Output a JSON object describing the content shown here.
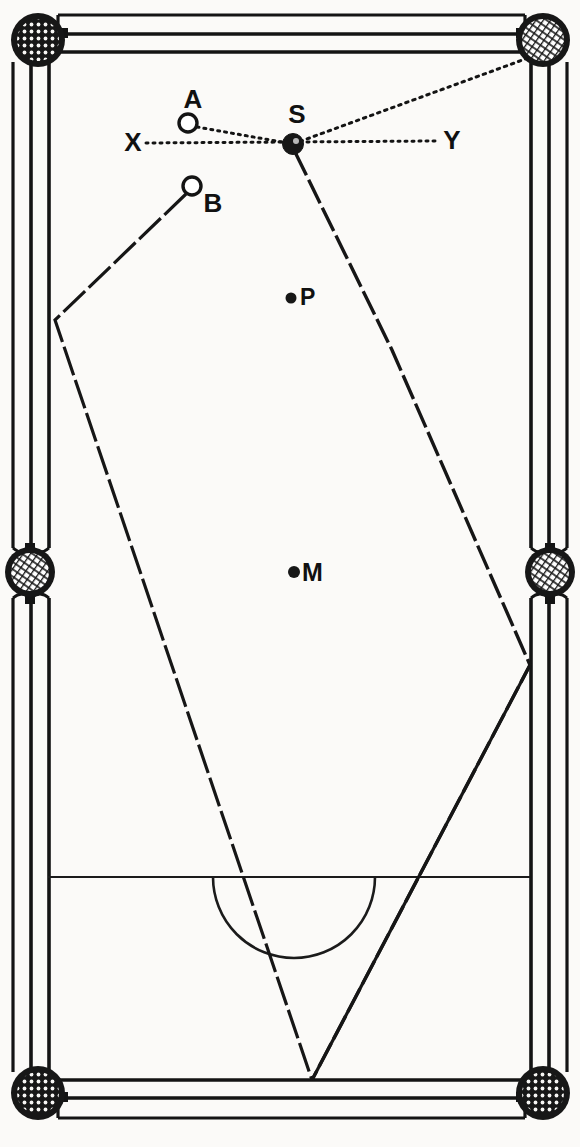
{
  "figure": {
    "kind": "billiard-table-diagram",
    "title_text": "",
    "width": 580,
    "height": 1147,
    "paper_color": "#fbfaf8",
    "ink_color": "#111111"
  },
  "table": {
    "name": "billiard-table",
    "outer_rect": {
      "x": 12,
      "y": 14,
      "w": 556,
      "h": 1118
    },
    "rail_lines_x": [
      12,
      30,
      48,
      530,
      548,
      568
    ],
    "rail_lines_y": [
      15,
      34,
      52,
      1080,
      1098,
      1118
    ],
    "playing_area": {
      "x": 48,
      "y": 52,
      "w": 482,
      "h": 1028
    },
    "cushion_color": "#111111"
  },
  "pockets": [
    {
      "id": "pocket-top-left",
      "label": "top left pocket",
      "cx": 38,
      "cy": 40,
      "r": 27
    },
    {
      "id": "pocket-top-right",
      "label": "top right pocket",
      "cx": 543,
      "cy": 40,
      "r": 27
    },
    {
      "id": "pocket-middle-left",
      "label": "middle left pocket",
      "cx": 30,
      "cy": 572,
      "r": 25
    },
    {
      "id": "pocket-middle-right",
      "label": "middle right pocket",
      "cx": 550,
      "cy": 572,
      "r": 25
    },
    {
      "id": "pocket-bottom-left",
      "label": "bottom left pocket",
      "cx": 38,
      "cy": 1093,
      "r": 27
    },
    {
      "id": "pocket-bottom-right",
      "label": "bottom right pocket",
      "cx": 543,
      "cy": 1093,
      "r": 27
    }
  ],
  "balls": [
    {
      "id": "ball-a",
      "label": "A",
      "cx": 188,
      "cy": 123,
      "r": 9,
      "style": "open",
      "label_x": 193,
      "label_y": 108,
      "label_anchor": "middle",
      "label_size": 26
    },
    {
      "id": "ball-b",
      "label": "B",
      "cx": 192,
      "cy": 186,
      "r": 9,
      "style": "open",
      "label_x": 213,
      "label_y": 212,
      "label_anchor": "middle",
      "label_size": 26
    },
    {
      "id": "ball-s",
      "label": "S",
      "cx": 293,
      "cy": 144,
      "r": 10,
      "style": "filled",
      "label_x": 297,
      "label_y": 123,
      "label_anchor": "middle",
      "label_size": 26
    }
  ],
  "spots": [
    {
      "id": "spot-p",
      "label": "P",
      "cx": 291,
      "cy": 298,
      "r": 5,
      "label_x": 300,
      "label_y": 305,
      "label_anchor": "start",
      "label_size": 22
    },
    {
      "id": "spot-m",
      "label": "M",
      "cx": 294,
      "cy": 572,
      "r": 6,
      "label_x": 302,
      "label_y": 581,
      "label_anchor": "start",
      "label_size": 24
    }
  ],
  "axis_line": {
    "id": "line-x-y",
    "label_left": "X",
    "label_right": "Y",
    "x1": 146,
    "y1": 143,
    "x2": 437,
    "y2": 141,
    "label_left_x": 133,
    "label_left_y": 150,
    "label_right_x": 452,
    "label_right_y": 148,
    "label_size": 26,
    "style": "dotted"
  },
  "trajectories": [
    {
      "id": "path-a-to-s",
      "name": "aim-line-a-to-s",
      "style": "dotted",
      "points": [
        [
          197,
          127
        ],
        [
          293,
          144
        ]
      ]
    },
    {
      "id": "path-s-to-top-right-pocket",
      "name": "pot-line-s-to-top-right-pocket",
      "style": "dotted",
      "points": [
        [
          293,
          144
        ],
        [
          528,
          58
        ]
      ]
    },
    {
      "id": "path-s-cushion-run",
      "name": "cue-ball-path-from-s",
      "style": "dashed",
      "points": [
        [
          295,
          152
        ],
        [
          392,
          350
        ],
        [
          530,
          665
        ],
        [
          312,
          1080
        ]
      ]
    },
    {
      "id": "path-b-cushion-run",
      "name": "object-ball-path-from-b",
      "style": "dashed",
      "points": [
        [
          186,
          194
        ],
        [
          55,
          320
        ],
        [
          312,
          1080
        ]
      ]
    }
  ],
  "markings": {
    "baulk_line": {
      "id": "baulk-line",
      "label": "baulk line",
      "x1": 48,
      "y1": 877,
      "x2": 530,
      "y2": 877
    },
    "d_semicircle": {
      "id": "d-semicircle",
      "label": "the D",
      "cx": 294,
      "cy": 877,
      "r": 81
    }
  }
}
